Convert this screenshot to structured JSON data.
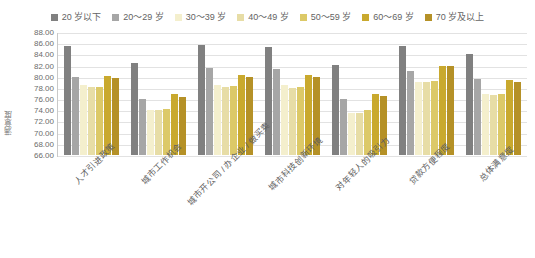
{
  "chart_data": {
    "type": "bar",
    "title": "",
    "subtitle": "",
    "xlabel": "",
    "ylabel": "满意度",
    "ylim": [
      66.0,
      88.0
    ],
    "ytick_step": 2.0,
    "ytick_labels": [
      "88.00",
      "86.00",
      "84.00",
      "82.00",
      "80.00",
      "78.00",
      "76.00",
      "74.00",
      "72.00",
      "70.00",
      "68.00",
      "66.00"
    ],
    "grid": true,
    "legend_position": "top-center",
    "categories": [
      "人才引进政策",
      "城市工作机会",
      "城市开公司 / 办企业 / 做买卖",
      "城市科技创新环境",
      "对年轻人的吸引力",
      "贷款方便程度",
      "总体满意度"
    ],
    "series": [
      {
        "name": "20 岁以下",
        "color": "#808080",
        "values": [
          85.5,
          82.5,
          85.6,
          85.4,
          82.1,
          85.5,
          84.1
        ]
      },
      {
        "name": "20～29 岁",
        "color": "#a6a6a6",
        "values": [
          80.0,
          76.1,
          81.5,
          81.3,
          76.0,
          81.0,
          79.6
        ]
      },
      {
        "name": "30～39 岁",
        "color": "#f4efcd",
        "values": [
          78.6,
          74.1,
          78.6,
          78.5,
          73.6,
          79.0,
          77.0
        ]
      },
      {
        "name": "40～49 岁",
        "color": "#e7dda6",
        "values": [
          78.2,
          74.0,
          78.1,
          78.0,
          73.5,
          79.0,
          76.8
        ]
      },
      {
        "name": "50～59 岁",
        "color": "#dcc968",
        "values": [
          78.2,
          74.2,
          78.3,
          78.2,
          74.0,
          79.3,
          77.0
        ]
      },
      {
        "name": "60～69 岁",
        "color": "#c9a92e",
        "values": [
          80.2,
          76.9,
          80.4,
          80.3,
          77.0,
          82.0,
          79.5
        ]
      },
      {
        "name": "70 岁及以上",
        "color": "#b59127",
        "values": [
          79.7,
          76.3,
          80.0,
          79.9,
          76.5,
          82.0,
          79.1
        ]
      }
    ]
  }
}
